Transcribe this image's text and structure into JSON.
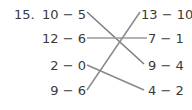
{
  "problem": {
    "number": "15.",
    "left_items": [
      "10 − 5",
      "12 − 6",
      "2 − 0",
      "9 − 6"
    ],
    "right_items": [
      "13 − 10",
      "7 − 1",
      "9 − 4",
      "4 − 2"
    ],
    "matches": [
      {
        "left": "10 − 5",
        "right": "9 − 4"
      },
      {
        "left": "12 − 6",
        "right": "7 − 1"
      },
      {
        "left": "2 − 0",
        "right": "4 − 2"
      },
      {
        "left": "9 − 6",
        "right": "13 − 10"
      }
    ]
  },
  "colors": {
    "text": "#3a3a3a",
    "line": "#8a8a8a"
  }
}
